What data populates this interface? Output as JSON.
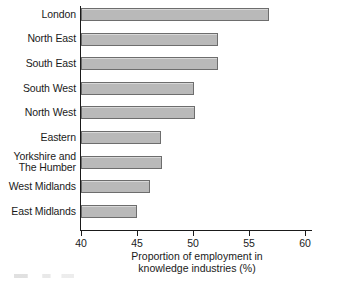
{
  "chart_data": {
    "type": "bar",
    "orientation": "horizontal",
    "title": "",
    "xlabel_lines": [
      "Proportion of employment in",
      "knowledge industries (%)"
    ],
    "ylabel": "",
    "xlim": [
      40,
      60
    ],
    "xticks": [
      40,
      45,
      50,
      55,
      60
    ],
    "xtick_labels": [
      "40",
      "45",
      "50",
      "55",
      "60"
    ],
    "grid": false,
    "legend": false,
    "bar_fill_color": "#b9b9b9",
    "bar_edge_color": "#6d6d6d",
    "axis_color": "#1a1a1a",
    "categories": [
      "London",
      "North East",
      "South East",
      "South West",
      "North West",
      "Eastern",
      "Yorkshire and\nThe Humber",
      "West Midlands",
      "East Midlands"
    ],
    "values": [
      56.8,
      52.2,
      52.2,
      50.1,
      50.2,
      47.1,
      47.2,
      46.2,
      45.0
    ]
  }
}
